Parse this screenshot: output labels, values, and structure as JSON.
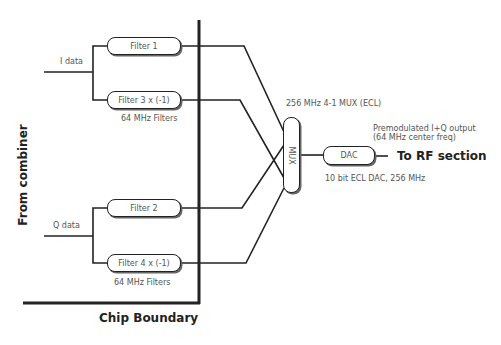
{
  "diagram": {
    "inputs": {
      "i_data": "I data",
      "q_data": "Q data"
    },
    "filters": [
      {
        "label": "Filter 1"
      },
      {
        "label": "Filter 3 x (-1)"
      },
      {
        "label": "Filter 2"
      },
      {
        "label": "Filter 4 x (-1)"
      }
    ],
    "filter_group_label_top": "64 MHz Filters",
    "filter_group_label_bottom": "64 MHz Filters",
    "source_label": "From combiner",
    "boundary_label": "Chip Boundary",
    "mux": {
      "label": "MUX",
      "caption": "256 MHz 4-1 MUX (ECL)"
    },
    "dac": {
      "label": "DAC",
      "caption": "10 bit ECL DAC, 256 MHz"
    },
    "output": {
      "note_line1": "Premodulated I+Q output",
      "note_line2": "(64 MHz center freq)",
      "destination": "To RF section"
    }
  }
}
